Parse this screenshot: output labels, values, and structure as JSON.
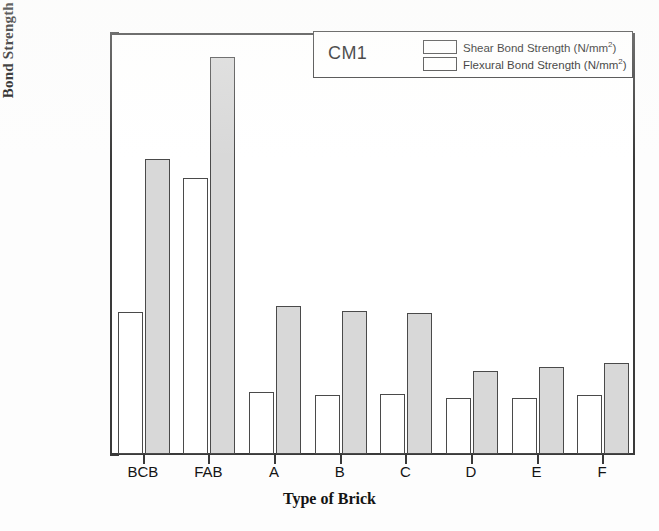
{
  "chart_data": {
    "type": "bar",
    "title": "",
    "annotation": "CM1",
    "xlabel": "Type of Brick",
    "ylabel": "Bond Strength (N/mm2)",
    "ylabel_base": "Bond Strength (N/mm",
    "ylabel_sup": "2",
    "ylabel_close": ")",
    "categories": [
      "BCB",
      "FAB",
      "A",
      "B",
      "C",
      "D",
      "E",
      "F"
    ],
    "series": [
      {
        "name": "Shear Bond Strength (N/mm2)",
        "name_base": "Shear Bond Strength (N/mm",
        "name_sup": "2",
        "name_close": ")",
        "fill": "#ffffff",
        "values": [
          0.101,
          0.196,
          0.044,
          0.042,
          0.043,
          0.04,
          0.04,
          0.042
        ]
      },
      {
        "name": "Flexural Bond Strength (N/mm2)",
        "name_base": "Flexural Bond Strength (N/mm",
        "name_sup": "2",
        "name_close": ")",
        "fill": "#d8d8d8",
        "values": [
          0.21,
          0.282,
          0.105,
          0.102,
          0.1,
          0.059,
          0.062,
          0.065
        ]
      }
    ],
    "ylim": [
      0.0,
      0.3
    ],
    "ytick_labels": [
      "0.00",
      "0.05",
      "0.10",
      "0.15",
      "0.20",
      "0.25",
      "0.30"
    ],
    "ytick_values": [
      0.0,
      0.05,
      0.1,
      0.15,
      0.2,
      0.25,
      0.3
    ],
    "yminor_values": [
      0.025,
      0.075,
      0.125,
      0.175,
      0.225,
      0.275
    ],
    "grid": false,
    "legend_position": "top-right-inside",
    "axis_color": "#3a3a3a"
  }
}
